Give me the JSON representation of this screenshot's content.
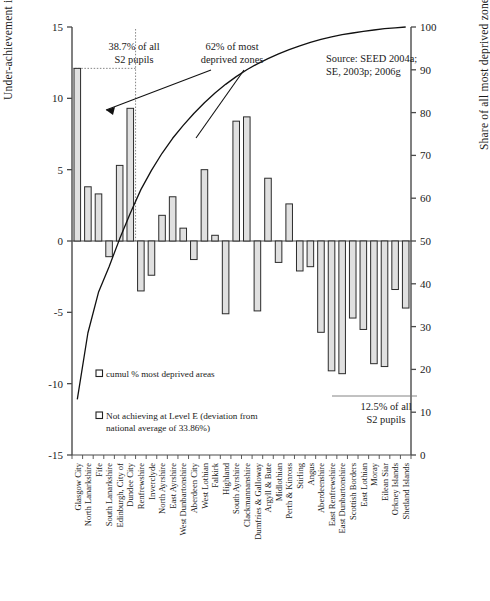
{
  "figure": {
    "axis_left_title": "Under-achievement in English (%)",
    "axis_right_title": "Share of all most deprived zones (%)",
    "source_line1": "Source: SEED 2004a;",
    "source_line2": "SE, 2003p; 2006g",
    "annotation_left_line1": "38.7% of all",
    "annotation_left_line2": "S2 pupils",
    "annotation_curve_line1": "62% of most",
    "annotation_curve_line2": "deprived zones",
    "annotation_right_line1": "12.5% of all",
    "annotation_right_line2": "S2 pupils",
    "legend_line_label": "cumul % most deprived areas",
    "legend_bar_label_line1": "Not achieving at Level E (deviation from",
    "legend_bar_label_line2": "national average of 33.86%)",
    "colors": {
      "bar_fill": "#e0e0e0",
      "bar_stroke": "#2b2b2b",
      "axis": "#4a4a4a",
      "curve": "#111111",
      "guide": "#777777"
    }
  },
  "chart_data": {
    "type": "bar",
    "title": "",
    "xlabel": "",
    "ylabel": "Under-achievement in English (%)",
    "ylabel_secondary": "Share of all most deprived zones (%)",
    "ylim": [
      -15,
      15
    ],
    "ylim_secondary": [
      0,
      100
    ],
    "yticks": [
      15,
      10,
      5,
      0,
      -5,
      -10,
      -15
    ],
    "yticks_secondary": [
      100,
      90,
      80,
      70,
      60,
      50,
      40,
      30,
      20,
      10,
      0
    ],
    "grid": false,
    "legend_position": "inside-lower-left",
    "categories": [
      "Glasgow City",
      "North Lanarkshire",
      "Fife",
      "South Lanarkshire",
      "Edinburgh, City of",
      "Dundee City",
      "Renfrewshire",
      "Inverclyde",
      "North Ayrshire",
      "East Ayrshire",
      "West Dunbartonshire",
      "Aberdeen City",
      "West Lothian",
      "Falkirk",
      "Highland",
      "South Ayrshire",
      "Clackmannanshire",
      "Dumfries & Galloway",
      "Argyll & Bute",
      "Midlothian",
      "Perth & Kinross",
      "Stirling",
      "Angus",
      "Aberdeenshire",
      "East Renfrewshire",
      "East Dunbartonshire",
      "Scottish Borders",
      "East Lothian",
      "Moray",
      "Eilean Siar",
      "Orkney Islands",
      "Shetland Islands"
    ],
    "series": [
      {
        "name": "Not achieving at Level E (deviation from national average of 33.86%)",
        "axis": "left",
        "type": "bar",
        "values": [
          12.1,
          3.8,
          3.3,
          -1.1,
          5.3,
          9.3,
          -3.5,
          -2.4,
          1.8,
          3.1,
          0.9,
          -1.3,
          5.0,
          0.4,
          -5.1,
          8.4,
          8.7,
          -4.9,
          4.4,
          -1.5,
          2.6,
          -2.1,
          -1.8,
          -6.4,
          -9.1,
          -9.3,
          -5.4,
          -6.2,
          -8.6,
          -8.8,
          -3.4,
          -4.7
        ]
      },
      {
        "name": "cumul % most deprived areas",
        "axis": "right",
        "type": "line",
        "values": [
          13.0,
          28.5,
          38.0,
          44.0,
          50.5,
          56.5,
          62.0,
          66.5,
          70.5,
          74.0,
          77.0,
          79.8,
          82.3,
          84.6,
          86.6,
          88.4,
          90.0,
          91.4,
          92.6,
          93.7,
          94.7,
          95.6,
          96.4,
          97.1,
          97.7,
          98.2,
          98.6,
          99.0,
          99.3,
          99.6,
          99.8,
          100.0
        ]
      }
    ],
    "annotations": [
      {
        "text": "38.7% of all S2 pupils",
        "note": "bracket over first 6 categories"
      },
      {
        "text": "62% of most deprived zones",
        "note": "points to curve at category 7"
      },
      {
        "text": "12.5% of all S2 pupils",
        "note": "right side, lower"
      },
      {
        "text": "Source: SEED 2004a; SE, 2003p; 2006g",
        "note": "top right"
      }
    ]
  }
}
